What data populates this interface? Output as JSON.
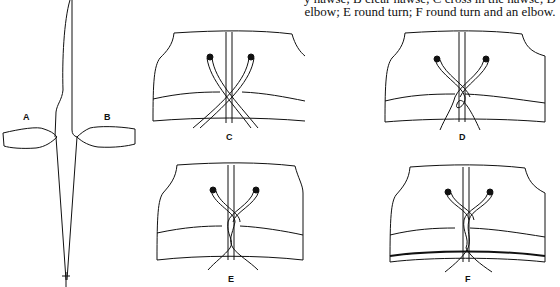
{
  "caption": {
    "line1": "y hawse; B clear hawse; C cross in the hawse; D",
    "line2": "elbow; E round turn; F round turn and an elbow."
  },
  "figure": {
    "labels": {
      "a": "A",
      "b": "B",
      "c": "C",
      "d": "D",
      "e": "E",
      "f": "F"
    }
  }
}
